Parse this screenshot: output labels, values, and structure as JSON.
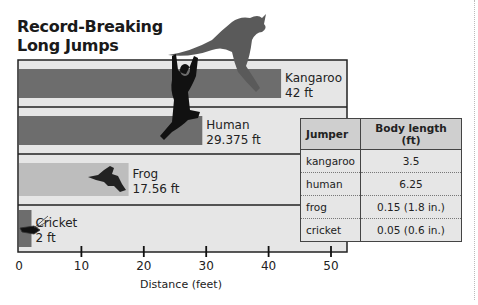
{
  "chart_data": {
    "type": "bar",
    "orientation": "horizontal",
    "title": "Record-Breaking Long Jumps",
    "xlabel": "Distance (feet)",
    "ylabel": "",
    "xlim": [
      0,
      50
    ],
    "xticks": [
      0,
      10,
      20,
      30,
      40,
      50
    ],
    "categories": [
      "Kangaroo",
      "Human",
      "Frog",
      "Cricket"
    ],
    "values": [
      42,
      29.375,
      17.56,
      2
    ],
    "value_labels": [
      "42 ft",
      "29.375 ft",
      "17.56 ft",
      "2 ft"
    ],
    "colors": {
      "bar": "#6d6d6d",
      "frog_bar": "#bdbdbd",
      "row_bg": "#e6e6e6",
      "frame": "#222222"
    },
    "grid": false,
    "legend": "none"
  },
  "table": {
    "headers": [
      "Jumper",
      "Body length (ft)"
    ],
    "rows": [
      [
        "kangaroo",
        "3.5"
      ],
      [
        "human",
        "6.25"
      ],
      [
        "frog",
        "0.15 (1.8 in.)"
      ],
      [
        "cricket",
        "0.05 (0.6 in.)"
      ]
    ]
  },
  "images": [
    "kangaroo-silhouette",
    "human-silhouette",
    "frog-silhouette",
    "cricket-silhouette"
  ]
}
